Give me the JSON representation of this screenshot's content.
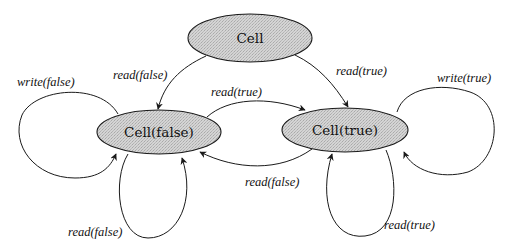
{
  "diagram": {
    "type": "state-machine",
    "colors": {
      "node_fill": "#cfcfcf",
      "stroke": "#1a1a1a",
      "background": "#ffffff"
    },
    "nodes": [
      {
        "id": "cell",
        "label": "Cell",
        "cx": 250,
        "cy": 38,
        "rx": 62,
        "ry": 24
      },
      {
        "id": "cell_false",
        "label": "Cell(false)",
        "cx": 159,
        "cy": 132,
        "rx": 62,
        "ry": 22
      },
      {
        "id": "cell_true",
        "label": "Cell(true)",
        "cx": 345,
        "cy": 130,
        "rx": 63,
        "ry": 22
      }
    ],
    "edges": [
      {
        "from": "cell",
        "to": "cell_false",
        "label": "read(false)"
      },
      {
        "from": "cell",
        "to": "cell_true",
        "label": "read(true)"
      },
      {
        "from": "cell_false",
        "to": "cell_true",
        "label": "read(true)"
      },
      {
        "from": "cell_true",
        "to": "cell_false",
        "label": "read(false)"
      },
      {
        "from": "cell_false",
        "to": "cell_false",
        "label": "write(false)"
      },
      {
        "from": "cell_false",
        "to": "cell_false",
        "label": "read(false)"
      },
      {
        "from": "cell_true",
        "to": "cell_true",
        "label": "write(true)"
      },
      {
        "from": "cell_true",
        "to": "cell_true",
        "label": "read(true)"
      }
    ]
  }
}
